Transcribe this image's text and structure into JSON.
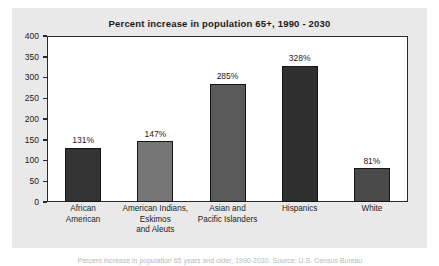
{
  "chart_data": {
    "type": "bar",
    "title": "Percent increase in population 65+, 1990 - 2030",
    "xlabel": "",
    "ylabel": "",
    "ylim": [
      0,
      400
    ],
    "yticks": [
      0,
      50,
      100,
      150,
      200,
      250,
      300,
      350,
      400
    ],
    "ytick_labels": [
      "0",
      "50",
      "100",
      "150",
      "200",
      "250",
      "300",
      "350",
      "400"
    ],
    "grid": false,
    "legend": "none",
    "categories": [
      "African American",
      "American Indians, Eskimos and Aleuts",
      "Asian and Pacific Islanders",
      "Hispanics",
      "White"
    ],
    "category_lines": [
      [
        "African",
        "American"
      ],
      [
        "American Indians,",
        "Eskimos",
        "and Aleuts"
      ],
      [
        "Asian and",
        "Pacific Islanders"
      ],
      [
        "Hispanics"
      ],
      [
        "White"
      ]
    ],
    "values": [
      131,
      147,
      285,
      328,
      81
    ],
    "value_labels": [
      "131%",
      "147%",
      "285%",
      "328%",
      "81%"
    ],
    "bar_colors": [
      "#343434",
      "#767676",
      "#5a5a5a",
      "#2f2f2f",
      "#4a4a4a"
    ]
  },
  "caption": {
    "text": "Percent increase in population 65 years and older, 1990-2030. Source: U.S. Census Bureau"
  },
  "colors": {
    "card_background": "#e9e9e9",
    "plot_background": "#ffffff",
    "axis": "#2b2b2b",
    "text": "#1a1a1a"
  }
}
